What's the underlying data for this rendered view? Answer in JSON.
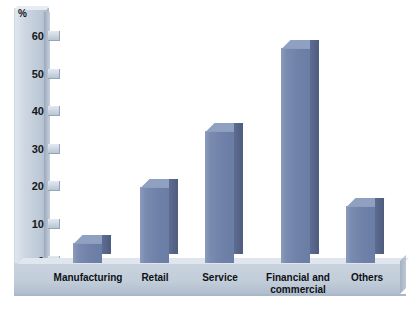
{
  "chart_data": {
    "type": "bar",
    "title": "",
    "xlabel": "",
    "ylabel": "%",
    "ylim": [
      0,
      60
    ],
    "yticks": [
      0,
      10,
      20,
      30,
      40,
      50,
      60
    ],
    "grid": false,
    "legend": "none",
    "categories": [
      "Manufacturing",
      "Retail",
      "Service",
      "Financial and commercial",
      "Others"
    ],
    "values": [
      5,
      20,
      35,
      57,
      15
    ],
    "colors": {
      "bar_front": "#7082ab",
      "bar_side": "#566687",
      "bar_top": "#8fa0c1",
      "axis_band": "#c3ced9",
      "background": "#ffffff",
      "text": "#0e1116"
    }
  },
  "axis": {
    "unit_label": "%",
    "tick_labels": [
      "60",
      "50",
      "40",
      "30",
      "20",
      "10",
      "0"
    ]
  },
  "categories": {
    "c0_line1": "Manufacturing",
    "c0_line2": "",
    "c1_line1": "Retail",
    "c1_line2": "",
    "c2_line1": "Service",
    "c2_line2": "",
    "c3_line1": "Financial and",
    "c3_line2": "commercial",
    "c4_line1": "Others",
    "c4_line2": ""
  }
}
